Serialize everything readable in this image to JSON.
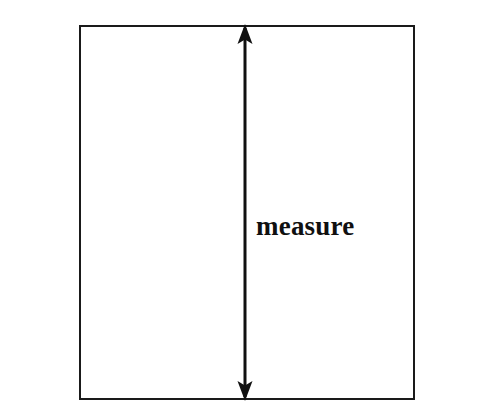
{
  "figure": {
    "background_color": "#ffffff",
    "line_color": "#1a1a1a",
    "fill_color": "#8a8a8a",
    "title": "measure"
  },
  "label": {
    "text": "measure"
  },
  "shapes": {
    "left_bar_name": "left hatched bar",
    "right_bar_name": "right hatched bar",
    "rect_name": "central open rectangle",
    "arrow_name": "vertical double-headed dimension arrow"
  }
}
